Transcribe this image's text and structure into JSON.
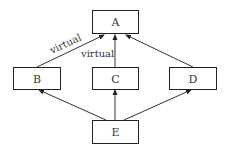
{
  "diagram": {
    "type": "inheritance-graph",
    "nodes": [
      {
        "id": "A",
        "label": "A"
      },
      {
        "id": "B",
        "label": "B"
      },
      {
        "id": "C",
        "label": "C"
      },
      {
        "id": "D",
        "label": "D"
      },
      {
        "id": "E",
        "label": "E"
      }
    ],
    "edges": [
      {
        "from": "B",
        "to": "A",
        "label": "virtual"
      },
      {
        "from": "C",
        "to": "A",
        "label": "virtual"
      },
      {
        "from": "D",
        "to": "A",
        "label": ""
      },
      {
        "from": "E",
        "to": "B",
        "label": ""
      },
      {
        "from": "E",
        "to": "C",
        "label": ""
      },
      {
        "from": "E",
        "to": "D",
        "label": ""
      }
    ],
    "colors": {
      "line": "#333333",
      "background": "#ffffff"
    }
  }
}
